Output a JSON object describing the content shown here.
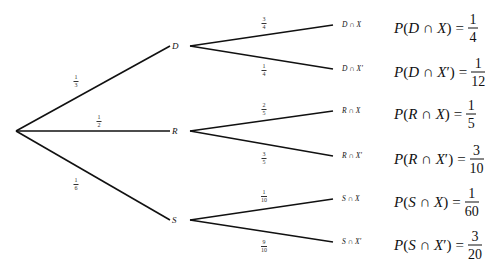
{
  "root": {
    "x": 16,
    "y": 131
  },
  "level1": [
    {
      "id": "D",
      "label": "D",
      "x": 176,
      "y": 46,
      "prob": {
        "num": "1",
        "den": "3"
      },
      "prob_pos": {
        "x": 76,
        "y": 81
      }
    },
    {
      "id": "R",
      "label": "R",
      "x": 176,
      "y": 131,
      "prob": {
        "num": "1",
        "den": "2"
      },
      "prob_pos": {
        "x": 99,
        "y": 121
      }
    },
    {
      "id": "S",
      "label": "S",
      "x": 176,
      "y": 220,
      "prob": {
        "num": "1",
        "den": "6"
      },
      "prob_pos": {
        "x": 76,
        "y": 184
      }
    }
  ],
  "level2": [
    {
      "parent": "D",
      "label": "D ∩ X",
      "x": 333,
      "y": 25,
      "prob": {
        "num": "3",
        "den": "4"
      },
      "prob_pos": {
        "x": 264,
        "y": 23
      },
      "result": {
        "lhs": "P(D ∩ X)",
        "num": "1",
        "den": "4"
      }
    },
    {
      "parent": "D",
      "label": "D ∩ X′",
      "x": 333,
      "y": 69,
      "prob": {
        "num": "1",
        "den": "4"
      },
      "prob_pos": {
        "x": 264,
        "y": 70
      },
      "result": {
        "lhs": "P(D ∩ X′)",
        "num": "1",
        "den": "12"
      }
    },
    {
      "parent": "R",
      "label": "R ∩ X",
      "x": 333,
      "y": 111,
      "prob": {
        "num": "2",
        "den": "5"
      },
      "prob_pos": {
        "x": 264,
        "y": 109
      },
      "result": {
        "lhs": "P(R ∩ X)",
        "num": "1",
        "den": "5"
      }
    },
    {
      "parent": "R",
      "label": "R ∩ X′",
      "x": 333,
      "y": 156,
      "prob": {
        "num": "3",
        "den": "5"
      },
      "prob_pos": {
        "x": 264,
        "y": 158
      },
      "result": {
        "lhs": "P(R ∩ X′)",
        "num": "3",
        "den": "10"
      }
    },
    {
      "parent": "S",
      "label": "S ∩ X",
      "x": 333,
      "y": 199,
      "prob": {
        "num": "1",
        "den": "10"
      },
      "prob_pos": {
        "x": 264,
        "y": 196
      },
      "result": {
        "lhs": "P(S ∩ X)",
        "num": "1",
        "den": "60"
      }
    },
    {
      "parent": "S",
      "label": "S ∩ X′",
      "x": 333,
      "y": 242,
      "prob": {
        "num": "9",
        "den": "10"
      },
      "prob_pos": {
        "x": 264,
        "y": 246
      },
      "result": {
        "lhs": "P(S ∩ X′)",
        "num": "3",
        "den": "20"
      }
    }
  ],
  "colors": {
    "line": "#111111",
    "background": "#ffffff",
    "text": "#111111"
  }
}
